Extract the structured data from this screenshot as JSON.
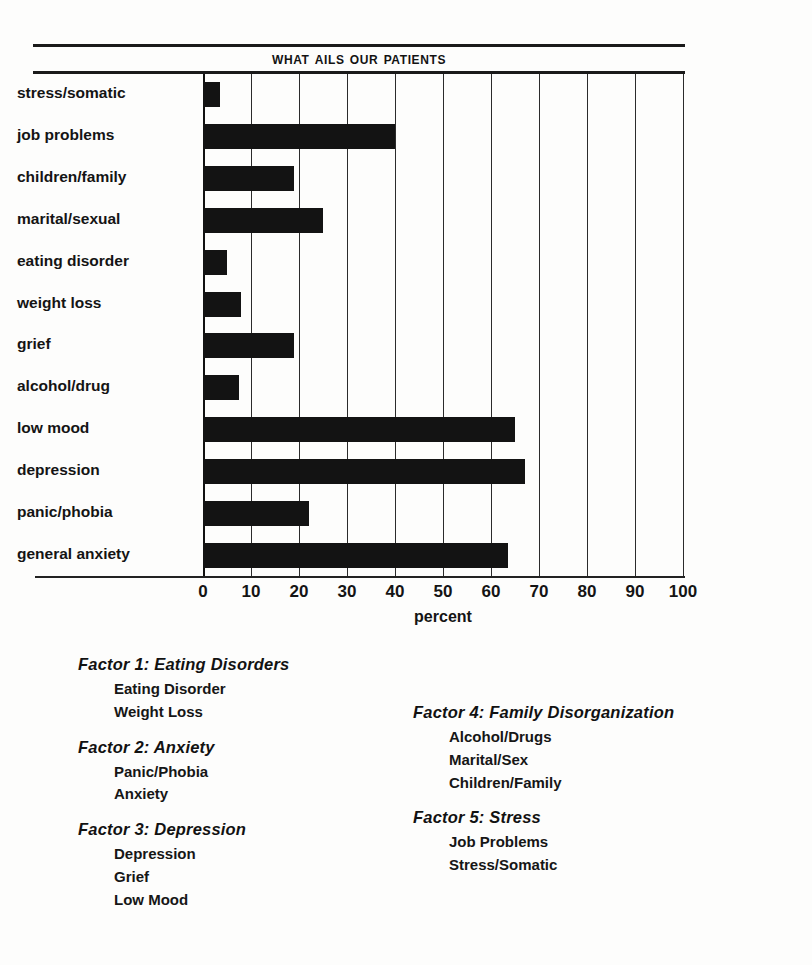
{
  "chart_data": {
    "type": "bar",
    "orientation": "horizontal",
    "title": "What Ails Our Patients",
    "xlabel": "percent",
    "ylabel": "",
    "xlim": [
      0,
      100
    ],
    "xticks": [
      "0",
      "10",
      "20",
      "30",
      "40",
      "50",
      "60",
      "70",
      "80",
      "90",
      "100"
    ],
    "grid": true,
    "legend": "none",
    "bar_color": "#131313",
    "categories": [
      "stress/somatic",
      "job problems",
      "children/family",
      "marital/sexual",
      "eating disorder",
      "weight loss",
      "grief",
      "alcohol/drug",
      "low mood",
      "depression",
      "panic/phobia",
      "general anxiety"
    ],
    "values": [
      3.5,
      40,
      19,
      25,
      5,
      8,
      19,
      7.5,
      65,
      67,
      22,
      63.5
    ]
  },
  "chart": {
    "title": "What Ails Our Patients",
    "xaxis_title": "percent"
  },
  "legend": {
    "left_column": [
      {
        "title": "Factor 1: Eating Disorders",
        "items": [
          "Eating Disorder",
          "Weight Loss"
        ]
      },
      {
        "title": "Factor 2: Anxiety",
        "items": [
          "Panic/Phobia",
          "Anxiety"
        ]
      },
      {
        "title": "Factor 3: Depression",
        "items": [
          "Depression",
          "Grief",
          "Low Mood"
        ]
      }
    ],
    "right_column": [
      {
        "title": "Factor 4: Family Disorganization",
        "items": [
          "Alcohol/Drugs",
          "Marital/Sex",
          "Children/Family"
        ]
      },
      {
        "title": "Factor 5: Stress",
        "items": [
          "Job Problems",
          "Stress/Somatic"
        ]
      }
    ]
  }
}
